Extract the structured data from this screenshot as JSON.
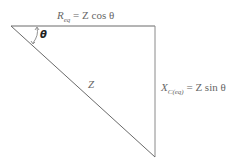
{
  "diagram": {
    "type": "impedance-triangle",
    "vertices": {
      "top_left": [
        11,
        26
      ],
      "top_right": [
        155,
        26
      ],
      "bottom_right": [
        155,
        157
      ]
    },
    "angle_label": "θ",
    "hypotenuse_label": "Z",
    "top_label": {
      "main": "R",
      "subscript": "eq",
      "rhs": "= Z cos θ"
    },
    "side_label": {
      "main": "X",
      "subscript": "C(eq)",
      "rhs": "= Z sin θ"
    },
    "colors": {
      "line": "#555555",
      "text": "#666666",
      "theta": "#222222"
    }
  }
}
